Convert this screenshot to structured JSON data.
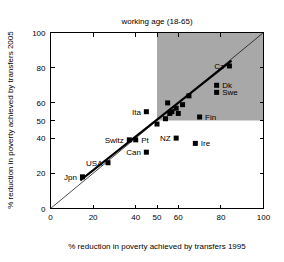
{
  "chart_data": {
    "type": "scatter",
    "title": "working age (18-65)",
    "xlabel": "% reduction in poverty achieved by transfers 1995",
    "ylabel": "% reduction in poverty achieved by transfers 2005",
    "xlim": [
      0,
      100
    ],
    "ylim": [
      0,
      100
    ],
    "xticks": [
      "0",
      "20",
      "40",
      "50",
      "60",
      "80",
      "100"
    ],
    "xtick_values": [
      0,
      20,
      40,
      50,
      60,
      80,
      100
    ],
    "yticks": [
      "0",
      "20",
      "40",
      "50",
      "60",
      "80",
      "100"
    ],
    "ytick_values": [
      0,
      20,
      40,
      50,
      60,
      80,
      100
    ],
    "grid": false,
    "legend": "none",
    "shaded_region": {
      "name": "high-performance-quadrant",
      "x_from": 50,
      "x_to": 100,
      "y_from": 50,
      "y_to": 100,
      "color": "#a8a8a8"
    },
    "reference_lines": [
      {
        "name": "identity-line",
        "description": "y = x diagonal",
        "from": [
          0,
          0
        ],
        "to": [
          100,
          100
        ]
      },
      {
        "name": "fit-line",
        "description": "thick trend line",
        "from": [
          14,
          16
        ],
        "to": [
          85,
          84
        ]
      }
    ],
    "points": [
      {
        "label": "Jpn",
        "x": 15,
        "y": 18,
        "label_pos": "left"
      },
      {
        "label": "USA",
        "x": 27,
        "y": 26,
        "label_pos": "left"
      },
      {
        "label": "Switz",
        "x": 37,
        "y": 39,
        "label_pos": "left"
      },
      {
        "label": "Pt",
        "x": 40,
        "y": 39,
        "label_pos": "right"
      },
      {
        "label": "Can",
        "x": 45,
        "y": 32,
        "label_pos": "left"
      },
      {
        "label": "Ita",
        "x": 45,
        "y": 55,
        "label_pos": "left"
      },
      {
        "label": "NZ",
        "x": 59,
        "y": 40,
        "label_pos": "left"
      },
      {
        "label": "Ire",
        "x": 68,
        "y": 37,
        "label_pos": "right"
      },
      {
        "label": "Fin",
        "x": 70,
        "y": 52,
        "label_pos": "right"
      },
      {
        "label": "Cz",
        "x": 84,
        "y": 81,
        "label_pos": "left"
      },
      {
        "label": "Dk",
        "x": 78,
        "y": 70,
        "label_pos": "right"
      },
      {
        "label": "Swe",
        "x": 78,
        "y": 66,
        "label_pos": "right"
      },
      {
        "label": "",
        "x": 50,
        "y": 48,
        "label_pos": "none"
      },
      {
        "label": "",
        "x": 54,
        "y": 51,
        "label_pos": "none"
      },
      {
        "label": "",
        "x": 55,
        "y": 60,
        "label_pos": "none"
      },
      {
        "label": "",
        "x": 56,
        "y": 54,
        "label_pos": "none"
      },
      {
        "label": "",
        "x": 57,
        "y": 55,
        "label_pos": "none"
      },
      {
        "label": "",
        "x": 59,
        "y": 57,
        "label_pos": "none"
      },
      {
        "label": "",
        "x": 60,
        "y": 54,
        "label_pos": "none"
      },
      {
        "label": "",
        "x": 62,
        "y": 59,
        "label_pos": "none"
      },
      {
        "label": "",
        "x": 65,
        "y": 64,
        "label_pos": "none"
      }
    ]
  }
}
